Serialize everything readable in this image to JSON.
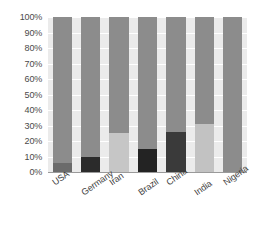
{
  "chart_data": {
    "type": "bar",
    "title": "",
    "subtitle": "",
    "xlabel": "",
    "ylabel": "",
    "stacked": true,
    "normalized_percent": true,
    "grid": true,
    "legend_position": "none",
    "ylim": [
      0,
      100
    ],
    "y_ticks": [
      "0%",
      "10%",
      "20%",
      "30%",
      "40%",
      "50%",
      "60%",
      "70%",
      "80%",
      "90%",
      "100%"
    ],
    "y_tick_values": [
      0,
      10,
      20,
      30,
      40,
      50,
      60,
      70,
      80,
      90,
      100
    ],
    "categories": [
      "USA",
      "Germany",
      "Iran",
      "Brazil",
      "China",
      "India",
      "Nigeria"
    ],
    "series": [
      {
        "name": "lower-segment",
        "values": [
          6,
          10,
          25,
          15,
          26,
          31,
          0
        ]
      },
      {
        "name": "upper-segment",
        "values": [
          94,
          90,
          75,
          85,
          74,
          69,
          100
        ]
      }
    ],
    "bars": [
      {
        "category": "USA",
        "lower": 6,
        "upper": 94,
        "lower_color": "#6b6b6b",
        "upper_color": "#8c8c8c"
      },
      {
        "category": "Germany",
        "lower": 10,
        "upper": 90,
        "lower_color": "#2b2b2b",
        "upper_color": "#8c8c8c"
      },
      {
        "category": "Iran",
        "lower": 25,
        "upper": 75,
        "lower_color": "#c6c6c6",
        "upper_color": "#8c8c8c"
      },
      {
        "category": "Brazil",
        "lower": 15,
        "upper": 85,
        "lower_color": "#232323",
        "upper_color": "#8c8c8c"
      },
      {
        "category": "China",
        "lower": 26,
        "upper": 74,
        "lower_color": "#3a3a3a",
        "upper_color": "#8c8c8c"
      },
      {
        "category": "India",
        "lower": 31,
        "upper": 69,
        "lower_color": "#c2c2c2",
        "upper_color": "#8c8c8c"
      },
      {
        "category": "Nigeria",
        "lower": 0,
        "upper": 100,
        "lower_color": "#8c8c8c",
        "upper_color": "#8c8c8c"
      }
    ],
    "colors": {
      "plot_background": "#ebebeb",
      "gridline": "#ffffff",
      "axis_line": "#9a9a9a",
      "tick_label": "#4a4a4a",
      "category_label": "#3d3d3d",
      "default_bar": "#8c8c8c"
    }
  }
}
